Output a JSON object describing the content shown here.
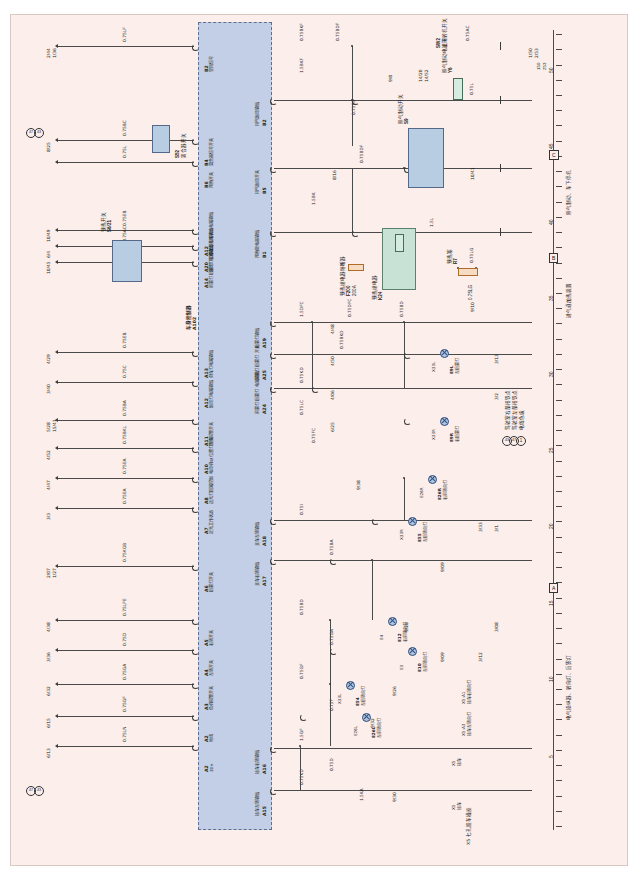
{
  "sheet": {
    "background": "#fbeeeb",
    "controller_fill": "#c3cfe6",
    "relay_fill": "#c9e2d6",
    "switch_fill": "#b9cde2"
  },
  "controller": {
    "id": "A102",
    "name": "车身控制器",
    "left_pins": [
      {
        "pin": "B2",
        "label": "空挡信号"
      },
      {
        "pin": "B4",
        "label": "离合器信号开关"
      },
      {
        "pin": "B6",
        "label": "预热开关"
      },
      {
        "pin": "A12",
        "label": "倒车灯工作状态电路输出"
      },
      {
        "pin": "A20",
        "label": "制动灯工作状态电路输出"
      },
      {
        "pin": "A14",
        "label": "前雾灯 后雾灯 电路输出"
      },
      {
        "pin": "A13",
        "label": "倒车灯电路输出"
      },
      {
        "pin": "A12",
        "label": "制动灯电路输出"
      },
      {
        "pin": "A11",
        "label": "危险报警开关"
      },
      {
        "pin": "A10",
        "label": "电动机W 位置灯开关"
      },
      {
        "pin": "A8",
        "label": "远光灯回路控制"
      },
      {
        "pin": "A7",
        "label": "近光工作状态"
      },
      {
        "pin": "A6",
        "label": "后雾灯开关"
      },
      {
        "pin": "A5",
        "label": "右转开关"
      },
      {
        "pin": "A4",
        "label": "左转开关"
      },
      {
        "pin": "A3",
        "label": "危机报警开关"
      },
      {
        "pin": "A2",
        "label": "地线"
      },
      {
        "pin": "A2",
        "label": "30+"
      }
    ],
    "right_pins": [
      {
        "pin": "B2",
        "label": "排气制动输出"
      },
      {
        "pin": "B5",
        "label": "排气制动开关"
      },
      {
        "pin": "B1",
        "label": "预热继电器输出"
      },
      {
        "pin": "A19",
        "label": "后雾灯输出"
      },
      {
        "pin": "A25",
        "label": "前雾灯 后雾灯 开关"
      },
      {
        "pin": "A24",
        "label": "前雾灯 后雾灯 电路输出"
      },
      {
        "pin": "A18",
        "label": "主车左转输出"
      },
      {
        "pin": "A17",
        "label": "主车右转输出"
      },
      {
        "pin": "A16",
        "label": "挂车右转输出"
      },
      {
        "pin": "A15",
        "label": "挂车左转输出"
      }
    ]
  },
  "left_terminals": [
    {
      "code": "2/44",
      "code2": "1/36",
      "wire": "0.75LF"
    },
    {
      "code": "8/25",
      "code2": "",
      "wire": "0.75BC"
    },
    {
      "code": "",
      "code2": "",
      "wire": "0.75L"
    },
    {
      "code": "10/49",
      "code2": "",
      "wire": "0.75EB"
    },
    {
      "code": "6/4",
      "code2": "",
      "wire": "0.75AC"
    },
    {
      "code": "10/45",
      "code2": "",
      "wire": "0.75BAC"
    },
    {
      "code": "4/29",
      "code2": "",
      "wire": "0.75EB"
    },
    {
      "code": "3/40",
      "code2": "",
      "wire": "0.75C"
    },
    {
      "code": "5/28",
      "code2": "15/41",
      "wire": "0.75BA"
    },
    {
      "code": "4/52",
      "code2": "",
      "wire": "0.75BKL"
    },
    {
      "code": "4/47",
      "code2": "",
      "wire": "0.75EA"
    },
    {
      "code": "3/3",
      "code2": "",
      "wire": "0.75EA"
    },
    {
      "code": "2/07",
      "code2": "1/27",
      "wire": "0.75KGB"
    },
    {
      "code": "4/38",
      "code2": "",
      "wire": "0.75LFE"
    },
    {
      "code": "3/36",
      "code2": "",
      "wire": "0.75D"
    },
    {
      "code": "6/32",
      "code2": "",
      "wire": "0.75GA"
    },
    {
      "code": "6/15",
      "code2": "",
      "wire": "0.75GF"
    },
    {
      "code": "6/13",
      "code2": "",
      "wire": "0.75LN"
    },
    {
      "code": "6/39",
      "code2": "",
      "wire": "0.75L"
    },
    {
      "code": "6/18",
      "code2": "",
      "wire": "0.75AD"
    }
  ],
  "components": {
    "s52": {
      "id": "S52",
      "label": "离合器开关",
      "pins": [
        "1",
        "2",
        "3"
      ],
      "wire_out": "0.75KB"
    },
    "s6_21": {
      "id": "S6/21",
      "label": "预热开关",
      "pins": [
        "5",
        "9",
        "10",
        "1"
      ]
    },
    "s9": {
      "id": "S9",
      "label": "排气制动开关",
      "pins": [
        "9",
        "10"
      ]
    },
    "sw2": {
      "id": "SW2",
      "label": "主下转机开关",
      "pins": [
        "1",
        "2"
      ]
    },
    "y6": {
      "id": "Y6",
      "label": "排气制动电磁阀"
    },
    "k24": {
      "id": "K24",
      "label": "预热继电器",
      "pins": [
        "B",
        "E"
      ]
    },
    "f200": {
      "id": "F200",
      "label": "预热继电器熔断器",
      "rating": "200A",
      "pins": [
        "1",
        "2"
      ]
    },
    "r7": {
      "id": "R7",
      "label": "预热塞",
      "wire": "0.75LG",
      "pins": [
        "1",
        "2"
      ]
    },
    "xc5": {
      "id": "XC5",
      "pins": [
        "1",
        "2",
        "3"
      ],
      "amps": "25A"
    }
  },
  "lamps": [
    {
      "id": "E9L",
      "label": "左后雾灯",
      "conn": "X33L",
      "pin": "6"
    },
    {
      "id": "E9R",
      "label": "右后雾灯",
      "conn": "X33R",
      "pin": "6"
    },
    {
      "id": "E26R",
      "label": "右前转向灯",
      "conn": "E26R",
      "pin": "1"
    },
    {
      "id": "E55",
      "label": "左后转向灯",
      "conn": "X33R",
      "pin": "2"
    },
    {
      "id": "E12",
      "label": "右前转向灯",
      "conn": "E4",
      "pin": "2"
    },
    {
      "id": "E10",
      "label": "左前转向灯",
      "conn": "E3",
      "pin": "2"
    },
    {
      "id": "E54",
      "label": "左后转向灯",
      "conn": "X33L",
      "pin": "2"
    },
    {
      "id": "E26L",
      "label": "左前转向灯",
      "conn": "E26L",
      "pin": "1"
    }
  ],
  "wire_labels": [
    "0.75BKF",
    "0.75BDF",
    "0.75AC",
    "1.5BKF",
    "0.75L",
    "0.75EB",
    "0.75BDF",
    "1.5BK",
    "1.5L",
    "0.75LG",
    "1.5DFC",
    "0.75DFC",
    "0.75BD",
    "0.75BKD",
    "0.75KD",
    "0.75LC",
    "0.75FC",
    "0.75I",
    "0.75BA",
    "0.75BD",
    "0.75GA",
    "0.75GF",
    "0.75F",
    "1.5GF",
    "0.75D",
    "0.75KD",
    "1.5KA",
    "1.5KF",
    "0.75KF",
    "1.5GA",
    "0.75KA"
  ],
  "right_labels": [
    {
      "code": "1/50",
      "code2": "2/53"
    },
    {
      "code": "9/8",
      "code2": ""
    },
    {
      "code": "14/20",
      "code2": "14/52"
    },
    {
      "code": "8/16",
      "code2": ""
    },
    {
      "code": "10/41",
      "code2": ""
    },
    {
      "code": "9/10",
      "code2": ""
    },
    {
      "code": "3/13",
      "code2": ""
    },
    {
      "code": "3/2",
      "code2": ""
    },
    {
      "code": "3/1",
      "code2": ""
    },
    {
      "code": "3/33",
      "code2": ""
    },
    {
      "code": "9/09",
      "code2": ""
    },
    {
      "code": "3/08",
      "code2": ""
    },
    {
      "code": "3/12",
      "code2": ""
    },
    {
      "code": "9/09",
      "code2": ""
    },
    {
      "code": "9/28",
      "code2": ""
    },
    {
      "code": "9/26",
      "code2": ""
    },
    {
      "code": "9/32",
      "code2": ""
    },
    {
      "code": "9/30",
      "code2": ""
    },
    {
      "code": "4/48",
      "code2": ""
    },
    {
      "code": "4/50",
      "code2": ""
    },
    {
      "code": "4/06",
      "code2": ""
    },
    {
      "code": "6/25",
      "code2": ""
    },
    {
      "code": "9/38",
      "code2": ""
    }
  ],
  "sections": [
    {
      "letter": "A",
      "title": "电气操纵器、转向灯、后雾灯"
    },
    {
      "letter": "B",
      "title": "进气道加热装置"
    },
    {
      "letter": "C",
      "title": "排气制动、车下停机"
    }
  ],
  "legend": {
    "items": [
      {
        "mark": "1",
        "text": "电线色级"
      },
      {
        "mark": "47",
        "text": "驾驶室左部搭铁点"
      },
      {
        "mark": "43",
        "text": "驾驶室右部搭铁点"
      }
    ]
  },
  "trailer_note": "X5 七孔挂车插座",
  "trailer_pins": [
    {
      "conn": "X5",
      "pin": "3",
      "label": "挂车"
    },
    {
      "conn": "X5",
      "pin": "5",
      "label": "挂车"
    },
    {
      "conn": "X5-A3",
      "label": "挂车左转向灯"
    },
    {
      "conn": "X5-A1",
      "label": "挂车右转向灯"
    }
  ],
  "ruler": {
    "numbers": [
      "5",
      "10",
      "15",
      "20",
      "25",
      "30",
      "35",
      "40",
      "45",
      "50"
    ],
    "end_codes": [
      "150",
      "253"
    ]
  }
}
